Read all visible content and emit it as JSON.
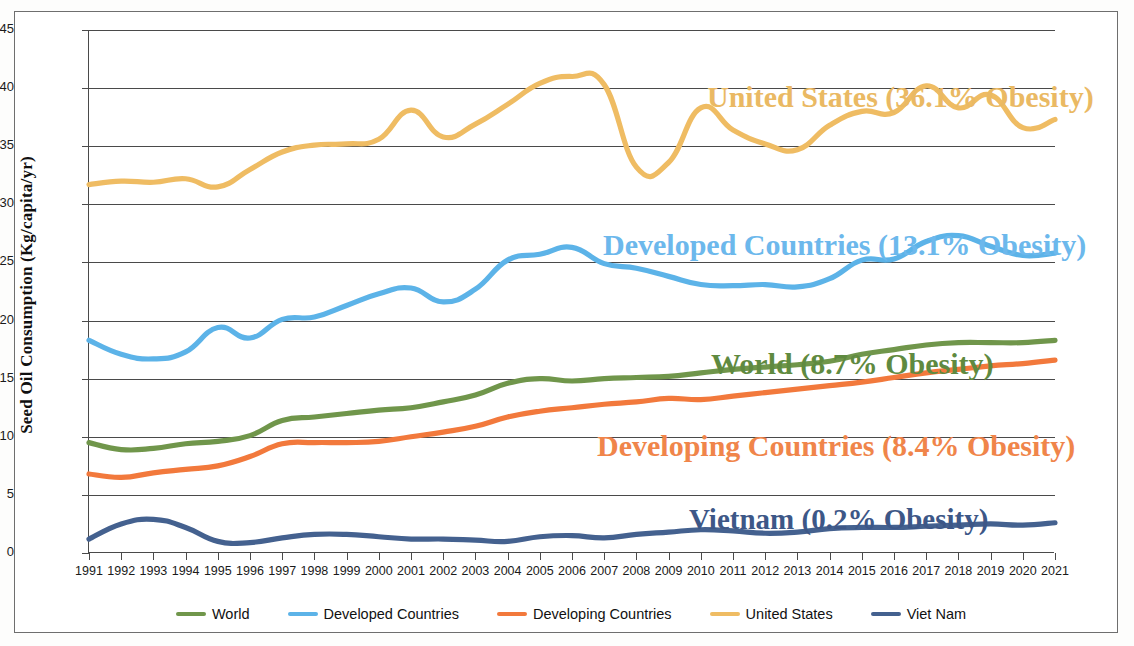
{
  "figure": {
    "clipped_title": "Seed Oil Consumption per Capita, Selected Regions, 1991-2021"
  },
  "axes": {
    "ylabel": "Seed Oil Consumption (Kg/capita/yr)",
    "xlabel": "",
    "yticks": [
      0,
      5,
      10,
      15,
      20,
      25,
      30,
      35,
      40,
      45
    ],
    "ylim": [
      0,
      45
    ],
    "grid": "horizontal"
  },
  "legend": {
    "position": "bottom-center",
    "items": [
      {
        "label": "World",
        "color": "#70964b"
      },
      {
        "label": "Developed Countries",
        "color": "#5cb3e8"
      },
      {
        "label": "Developing Countries",
        "color": "#f2793c"
      },
      {
        "label": "United States",
        "color": "#efbc63"
      },
      {
        "label": "Viet Nam",
        "color": "#44618f"
      }
    ]
  },
  "annotations": [
    {
      "name": "united-states",
      "text": "United States (36.1% Obesity)",
      "color": "#eab963"
    },
    {
      "name": "developed-countries",
      "text": "Developed Countries (13.1% Obesity)",
      "color": "#6cb8ec"
    },
    {
      "name": "world",
      "text": "World (8.7% Obesity)",
      "color": "#5f8a40"
    },
    {
      "name": "developing-countries",
      "text": "Developing Countries (8.4% Obesity)",
      "color": "#f0854a"
    },
    {
      "name": "vietnam",
      "text": "Vietnam (0.2% Obesity)",
      "color": "#3d5787"
    }
  ],
  "chart_data": {
    "type": "line",
    "title": "Seed Oil Consumption per Capita, Selected Regions, 1991-2021",
    "xlabel": "",
    "ylabel": "Seed Oil Consumption (Kg/capita/yr)",
    "ylim": [
      0,
      45
    ],
    "yticks": [
      0,
      5,
      10,
      15,
      20,
      25,
      30,
      35,
      40,
      45
    ],
    "grid": true,
    "legend_position": "bottom-center",
    "x": [
      1991,
      1992,
      1993,
      1994,
      1995,
      1996,
      1997,
      1998,
      1999,
      2000,
      2001,
      2002,
      2003,
      2004,
      2005,
      2006,
      2007,
      2008,
      2009,
      2010,
      2011,
      2012,
      2013,
      2014,
      2015,
      2016,
      2017,
      2018,
      2019,
      2020,
      2021
    ],
    "series": [
      {
        "name": "United States",
        "color": "#efbc63",
        "obesity": "36.1%",
        "values": [
          31.7,
          32.0,
          31.9,
          32.2,
          31.5,
          33.0,
          34.5,
          35.1,
          35.2,
          35.6,
          38.1,
          35.8,
          36.9,
          38.6,
          40.4,
          41.0,
          40.3,
          33.2,
          33.6,
          38.3,
          36.4,
          35.2,
          34.7,
          36.8,
          38.0,
          37.9,
          40.2,
          38.3,
          39.4,
          36.6,
          37.3
        ]
      },
      {
        "name": "Developed Countries",
        "color": "#5cb3e8",
        "obesity": "13.1%",
        "values": [
          18.3,
          17.1,
          16.7,
          17.3,
          19.4,
          18.5,
          20.1,
          20.3,
          21.3,
          22.3,
          22.8,
          21.6,
          22.7,
          25.2,
          25.7,
          26.3,
          24.9,
          24.5,
          23.8,
          23.1,
          23.0,
          23.1,
          22.9,
          23.6,
          25.2,
          25.3,
          26.8,
          27.3,
          26.4,
          25.6,
          25.8
        ]
      },
      {
        "name": "World",
        "color": "#70964b",
        "obesity": "8.7%",
        "values": [
          9.5,
          8.9,
          9.0,
          9.4,
          9.6,
          10.1,
          11.4,
          11.7,
          12.0,
          12.3,
          12.5,
          13.0,
          13.6,
          14.6,
          15.0,
          14.8,
          15.0,
          15.1,
          15.2,
          15.5,
          15.8,
          16.0,
          16.2,
          16.5,
          17.1,
          17.5,
          17.9,
          18.1,
          18.1,
          18.1,
          18.3
        ]
      },
      {
        "name": "Developing Countries",
        "color": "#f2793c",
        "obesity": "8.4%",
        "values": [
          6.8,
          6.5,
          6.9,
          7.2,
          7.5,
          8.3,
          9.4,
          9.5,
          9.5,
          9.6,
          10.0,
          10.4,
          10.9,
          11.7,
          12.2,
          12.5,
          12.8,
          13.0,
          13.3,
          13.2,
          13.5,
          13.8,
          14.1,
          14.4,
          14.7,
          15.1,
          15.5,
          15.8,
          16.1,
          16.3,
          16.6
        ]
      },
      {
        "name": "Viet Nam",
        "color": "#44618f",
        "obesity": "0.2%",
        "values": [
          1.2,
          2.5,
          2.9,
          2.2,
          1.0,
          0.9,
          1.3,
          1.6,
          1.6,
          1.4,
          1.2,
          1.2,
          1.1,
          1.0,
          1.4,
          1.5,
          1.3,
          1.6,
          1.8,
          2.0,
          1.9,
          1.7,
          1.8,
          2.1,
          2.2,
          2.2,
          2.3,
          2.4,
          2.5,
          2.4,
          2.6
        ]
      }
    ]
  }
}
